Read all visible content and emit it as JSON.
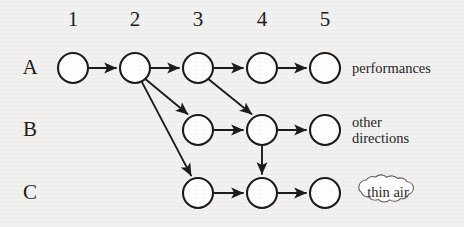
{
  "figure": {
    "type": "node-link-lattice-diagram",
    "background_color": "#f2f1ef",
    "stroke_color": "#1b1b1b",
    "node_fill_color": "#ffffff"
  },
  "column_headers": [
    {
      "label": "1",
      "x": 73
    },
    {
      "label": "2",
      "x": 135
    },
    {
      "label": "3",
      "x": 198
    },
    {
      "label": "4",
      "x": 262
    },
    {
      "label": "5",
      "x": 325
    }
  ],
  "row_labels": [
    {
      "label": "A",
      "y": 68
    },
    {
      "label": "B",
      "y": 130
    },
    {
      "label": "C",
      "y": 193
    }
  ],
  "nodes": [
    {
      "id": "A1",
      "row": "A",
      "col": "1",
      "cx": 73,
      "cy": 68,
      "r": 15
    },
    {
      "id": "A2",
      "row": "A",
      "col": "2",
      "cx": 135,
      "cy": 68,
      "r": 15
    },
    {
      "id": "A3",
      "row": "A",
      "col": "3",
      "cx": 198,
      "cy": 68,
      "r": 15
    },
    {
      "id": "A4",
      "row": "A",
      "col": "4",
      "cx": 262,
      "cy": 68,
      "r": 15
    },
    {
      "id": "A5",
      "row": "A",
      "col": "5",
      "cx": 325,
      "cy": 68,
      "r": 15
    },
    {
      "id": "B3",
      "row": "B",
      "col": "3",
      "cx": 198,
      "cy": 130,
      "r": 15
    },
    {
      "id": "B4",
      "row": "B",
      "col": "4",
      "cx": 262,
      "cy": 130,
      "r": 15
    },
    {
      "id": "B5",
      "row": "B",
      "col": "5",
      "cx": 325,
      "cy": 130,
      "r": 15
    },
    {
      "id": "C3",
      "row": "C",
      "col": "3",
      "cx": 198,
      "cy": 193,
      "r": 15
    },
    {
      "id": "C4",
      "row": "C",
      "col": "4",
      "cx": 262,
      "cy": 193,
      "r": 15
    },
    {
      "id": "C5",
      "row": "C",
      "col": "5",
      "cx": 325,
      "cy": 193,
      "r": 15
    }
  ],
  "edges": [
    {
      "from": "A1",
      "to": "A2",
      "kind": "horizontal"
    },
    {
      "from": "A2",
      "to": "A3",
      "kind": "horizontal"
    },
    {
      "from": "A3",
      "to": "A4",
      "kind": "horizontal"
    },
    {
      "from": "A4",
      "to": "A5",
      "kind": "horizontal"
    },
    {
      "from": "A2",
      "to": "B3",
      "kind": "diagonal"
    },
    {
      "from": "A2",
      "to": "C3",
      "kind": "diagonal"
    },
    {
      "from": "A3",
      "to": "B4",
      "kind": "diagonal"
    },
    {
      "from": "B3",
      "to": "B4",
      "kind": "horizontal"
    },
    {
      "from": "B4",
      "to": "B5",
      "kind": "horizontal"
    },
    {
      "from": "B4",
      "to": "C4",
      "kind": "vertical"
    },
    {
      "from": "C3",
      "to": "C4",
      "kind": "horizontal"
    },
    {
      "from": "C4",
      "to": "C5",
      "kind": "horizontal"
    }
  ],
  "annotations": {
    "row_a_label": {
      "text": "performances",
      "x": 352,
      "y": 61
    },
    "row_b_label": {
      "text": "other\ndirections",
      "x": 352,
      "y": 115
    },
    "row_c_cloud": {
      "text": "thin air",
      "x": 351,
      "y": 181,
      "shape": "cloud"
    }
  }
}
